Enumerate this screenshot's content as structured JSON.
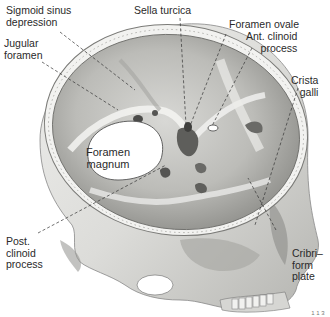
{
  "figure": {
    "page_number": "1 1 3"
  },
  "labels": [
    {
      "id": "sigmoid",
      "text": "Sigmoid sinus\ndepression"
    },
    {
      "id": "jugular",
      "text": "Jugular\nforamen"
    },
    {
      "id": "sella",
      "text": "Sella turcica"
    },
    {
      "id": "ovale",
      "text": "Foramen ovale"
    },
    {
      "id": "antclin",
      "text": "Ant. clinoid\nprocess"
    },
    {
      "id": "crista",
      "text": "Crista\ngalli"
    },
    {
      "id": "magnum",
      "text": "Foramen\nmagnum"
    },
    {
      "id": "postclin",
      "text": "Post.\nclinoid\nprocess"
    },
    {
      "id": "cribri",
      "text": "Cribri–\nform\nplate"
    }
  ],
  "colors": {
    "bone_light": "#e9e9e7",
    "bone_mid": "#c9c9c6",
    "bone_dark": "#8e8e8b",
    "shadow": "#5a5a58",
    "text": "#2a2a2a"
  }
}
